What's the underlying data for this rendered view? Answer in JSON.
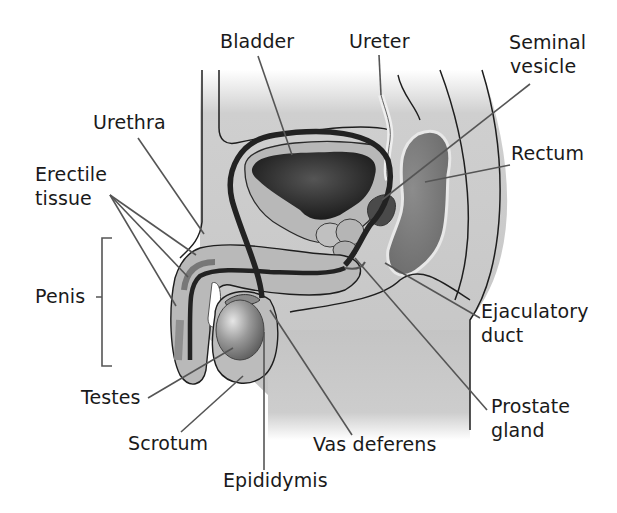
{
  "diagram": {
    "labels": {
      "bladder": "Bladder",
      "ureter": "Ureter",
      "seminal_vesicle_1": "Seminal",
      "seminal_vesicle_2": "vesicle",
      "urethra": "Urethra",
      "rectum": "Rectum",
      "erectile_1": "Erectile",
      "erectile_2": "tissue",
      "penis": "Penis",
      "ejaculatory_1": "Ejaculatory",
      "ejaculatory_2": "duct",
      "testes": "Testes",
      "prostate_1": "Prostate",
      "prostate_2": "gland",
      "scrotum": "Scrotum",
      "vas_deferens": "Vas deferens",
      "epididymis": "Epididymis"
    },
    "colors": {
      "tissue_light": "#c8c8c8",
      "tissue_mid": "#a9a9a9",
      "tissue_dark": "#7a7a7a",
      "bladder_inner": "#2a2a2a",
      "duct": "#222222",
      "leader_line": "#555555",
      "outline": "#1e1e1e"
    }
  }
}
